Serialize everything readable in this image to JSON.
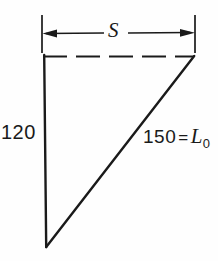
{
  "figure": {
    "type": "geometry-diagram",
    "background_color": "#fefefe",
    "stroke_color": "#1a1a1a",
    "labels": {
      "span": "S",
      "vertical_side": "120",
      "hypotenuse_value": "150",
      "hypotenuse_equals": "=",
      "hypotenuse_symbol": "L",
      "hypotenuse_subscript": "0"
    },
    "geometry": {
      "top_left": [
        44,
        57
      ],
      "top_right": [
        194,
        57
      ],
      "bottom": [
        46,
        247
      ],
      "dimension_line_y": 33,
      "extension_line_top_y": 15,
      "extension_line_bottom_y": 53,
      "extension_left_x": 42,
      "extension_right_x": 195,
      "top_edge_style": "dashed",
      "left_edge_style": "solid",
      "hypotenuse_style": "solid"
    }
  }
}
